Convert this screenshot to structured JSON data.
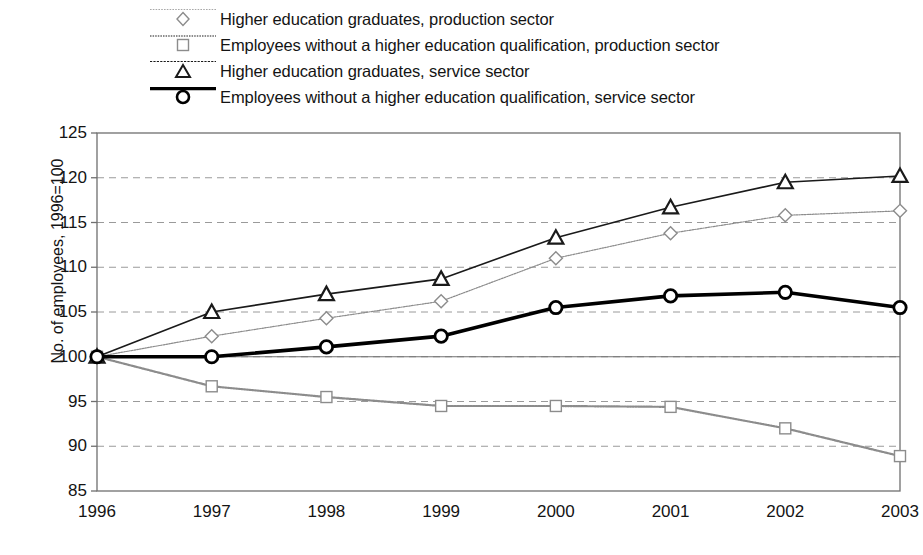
{
  "chart_data": {
    "type": "line",
    "title": "",
    "xlabel": "",
    "ylabel": "No. of employees, 1996=100",
    "categories": [
      "1996",
      "1997",
      "1998",
      "1999",
      "2000",
      "2001",
      "2002",
      "2003"
    ],
    "x": [
      1996,
      1997,
      1998,
      1999,
      2000,
      2001,
      2002,
      2003
    ],
    "ylim": [
      85,
      125
    ],
    "yticks": [
      85,
      90,
      95,
      100,
      105,
      110,
      115,
      120,
      125
    ],
    "ytick_labels": [
      "85",
      "90",
      "95",
      "100",
      "105",
      "110",
      "115",
      "120",
      "125"
    ],
    "grid": "horizontal-dashed",
    "legend_position": "above-plot-left",
    "series": [
      {
        "name": "Higher education graduates, production sector",
        "marker": "diamond",
        "color": "#8c8c8c",
        "line_width": 1.2,
        "values": [
          100.0,
          102.3,
          104.3,
          106.2,
          111.0,
          113.8,
          115.8,
          116.3
        ]
      },
      {
        "name": "Employees without a higher education qualification, production sector",
        "marker": "square",
        "color": "#8c8c8c",
        "line_width": 2.2,
        "values": [
          100.0,
          96.7,
          95.5,
          94.5,
          94.5,
          94.4,
          92.0,
          88.9
        ]
      },
      {
        "name": "Higher education graduates, service sector",
        "marker": "triangle",
        "color": "#1a1a1a",
        "line_width": 1.6,
        "values": [
          100.0,
          105.0,
          107.0,
          108.7,
          113.3,
          116.7,
          119.5,
          120.2
        ]
      },
      {
        "name": "Employees without a higher education qualification, service sector",
        "marker": "circle",
        "color": "#000000",
        "line_width": 3.6,
        "values": [
          100.0,
          100.0,
          101.1,
          102.3,
          105.5,
          106.8,
          107.2,
          105.5
        ]
      }
    ]
  },
  "legend": {
    "items": [
      {
        "label": "Higher education graduates, production sector",
        "marker": "diamond-icon"
      },
      {
        "label": "Employees without a higher education qualification, production sector",
        "marker": "square-icon"
      },
      {
        "label": "Higher education graduates, service sector",
        "marker": "triangle-icon"
      },
      {
        "label": "Employees without a higher education qualification, service sector",
        "marker": "circle-icon"
      }
    ]
  },
  "colors": {
    "light_series": "#8c8c8c",
    "dark_series": "#1a1a1a",
    "bold_series": "#000000",
    "grid": "#9a9a9a",
    "frame": "#6f6f6f",
    "text": "#141414",
    "background": "#ffffff"
  }
}
